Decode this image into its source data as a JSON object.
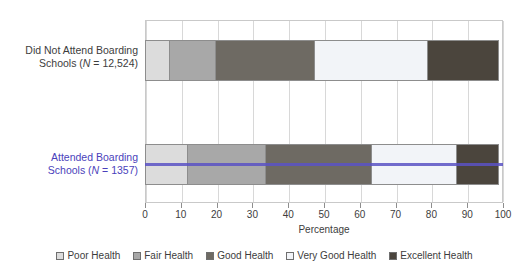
{
  "chart_data": {
    "type": "bar",
    "orientation": "horizontal",
    "stacked": true,
    "title": "",
    "xlabel": "Percentage",
    "ylabel": "",
    "xlim": [
      0,
      100
    ],
    "xticks": [
      0,
      10,
      20,
      30,
      40,
      50,
      60,
      70,
      80,
      90,
      100
    ],
    "grid": true,
    "legend_position": "bottom",
    "categories": [
      "Did Not Attend Boarding Schools (N = 12,524)",
      "Attended Boarding Schools (N = 1357)"
    ],
    "series": [
      {
        "name": "Poor Health",
        "color": "#dcdcdc",
        "values": [
          7,
          12
        ]
      },
      {
        "name": "Fair Health",
        "color": "#a8a8a8",
        "values": [
          13,
          22
        ]
      },
      {
        "name": "Good Health",
        "color": "#6e6a63",
        "values": [
          28,
          30
        ]
      },
      {
        "name": "Very Good Health",
        "color": "#f2f4f8",
        "values": [
          32,
          24
        ]
      },
      {
        "name": "Excellent Health",
        "color": "#4b453d",
        "values": [
          20,
          12
        ]
      }
    ],
    "cumulative_boundaries": {
      "row1": [
        0,
        7,
        20,
        48,
        80,
        100
      ],
      "row2": [
        0,
        12,
        34,
        64,
        88,
        100
      ]
    }
  },
  "axis": {
    "x_title": "Percentage",
    "x_tick_labels": [
      "0",
      "10",
      "20",
      "30",
      "40",
      "50",
      "60",
      "70",
      "80",
      "90",
      "100"
    ]
  },
  "rows": [
    {
      "label_line1": "Did Not Attend Boarding",
      "label_line2_pre": "Schools (",
      "label_line2_n": "N",
      "label_line2_post": " = 12,524)",
      "selected": false
    },
    {
      "label_line1": "Attended Boarding",
      "label_line2_pre": "Schools (",
      "label_line2_n": "N",
      "label_line2_post": " = 1357)",
      "selected": true
    }
  ],
  "legend": {
    "items": [
      {
        "label": "Poor Health",
        "color": "#dcdcdc"
      },
      {
        "label": "Fair Health",
        "color": "#a8a8a8"
      },
      {
        "label": "Good Health",
        "color": "#6e6a63"
      },
      {
        "label": "Very Good Health",
        "color": "#f2f4f8"
      },
      {
        "label": "Excellent Health",
        "color": "#4b453d"
      }
    ]
  },
  "colors": {
    "highlight_line": "#5b52c4",
    "selected_label_text": "#4a3fbb",
    "grid": "#d8d8d8",
    "frame": "#c9c9c9",
    "segment_border": "#8d8d8d"
  }
}
